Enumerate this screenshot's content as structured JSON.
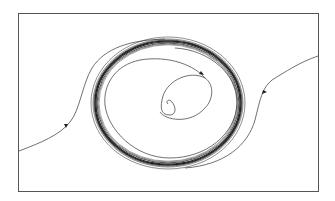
{
  "diagram": {
    "type": "phase-portrait",
    "frame": {
      "x": 18,
      "y": 13,
      "width": 301,
      "height": 179
    },
    "limit_cycle": {
      "cx": 168,
      "cy": 103,
      "rx": 73,
      "ry": 62
    },
    "colors": {
      "stroke": "#333333",
      "band": "#222222",
      "frame": "#555555",
      "background": "#ffffff"
    },
    "trajectories": [
      {
        "name": "inner-spiral",
        "direction": "outward"
      },
      {
        "name": "outer-left",
        "direction": "inward"
      },
      {
        "name": "outer-right",
        "direction": "inward"
      }
    ]
  }
}
